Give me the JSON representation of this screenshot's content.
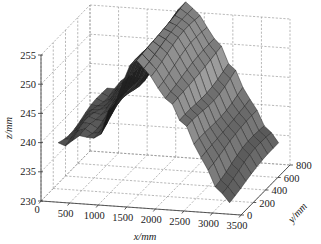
{
  "chart_data": {
    "type": "surface3d",
    "title": "",
    "xlabel": "x/mm",
    "ylabel": "y/mm",
    "zlabel": "z/mm",
    "x_ticks": [
      0,
      500,
      1000,
      1500,
      2000,
      2500,
      3000,
      3500
    ],
    "y_ticks": [
      0,
      200,
      400,
      600,
      800
    ],
    "z_ticks": [
      230,
      235,
      240,
      245,
      250,
      255
    ],
    "xlim": [
      0,
      3500
    ],
    "ylim": [
      0,
      800
    ],
    "zlim": [
      230,
      255
    ],
    "grid": true,
    "colormap": "gray",
    "surface": {
      "x_range": [
        300,
        3300
      ],
      "y_range": [
        0,
        800
      ],
      "x_samples": 24,
      "y_samples": 9,
      "profile_x": [
        300,
        700,
        1000,
        1300,
        1550,
        1700,
        1900,
        2200,
        2500,
        2800,
        3100,
        3300
      ],
      "profile_z": [
        240.5,
        242.0,
        243.5,
        248.0,
        254.5,
        256.0,
        254.0,
        250.0,
        245.0,
        240.0,
        235.5,
        233.0
      ],
      "y_tilt_per_800mm": 1.5,
      "notes": "Ridge-shaped measured surface: low at left end (~240 mm), peak near x≈1700 mm (~256 mm), descending to ~231–236 mm at right end."
    }
  },
  "axes": {
    "z_label": "z/mm",
    "x_label": "x/mm",
    "y_label": "y/mm",
    "z_tick_labels": [
      "230",
      "235",
      "240",
      "245",
      "250",
      "255"
    ],
    "x_tick_labels": [
      "0",
      "500",
      "1000",
      "1500",
      "2000",
      "2500",
      "3000",
      "3500"
    ],
    "y_tick_labels": [
      "0",
      "200",
      "400",
      "600",
      "800"
    ]
  }
}
